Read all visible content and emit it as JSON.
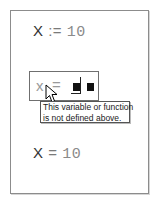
{
  "worksheet": {
    "definition": {
      "variable": "X",
      "operator": ":=",
      "value": "10"
    },
    "input": {
      "variable": "x",
      "operator": "=",
      "placeholders": 2
    },
    "tooltip": {
      "line1": "This variable or function",
      "line2": "is not defined above."
    },
    "result": {
      "variable": "X",
      "operator": "=",
      "value": "10"
    }
  },
  "colors": {
    "frame_border": "#8c8c8c",
    "math_text": "#7a7a7a",
    "placeholder": "#111111"
  }
}
